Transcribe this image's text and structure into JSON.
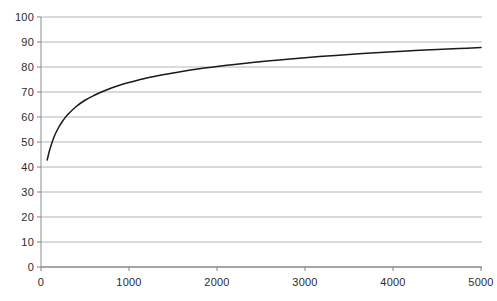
{
  "chart_data": {
    "type": "line",
    "title": "",
    "subtitle": "",
    "xlabel": "",
    "ylabel": "",
    "xlim": [
      0,
      5000
    ],
    "ylim": [
      0,
      100
    ],
    "grid": "horizontal",
    "legend": "none",
    "line_color": "#1a1a1a",
    "grid_color": "#b5b5b5",
    "axis_color": "#808080",
    "background_color": "#ffffff",
    "x_ticks": [
      0,
      1000,
      2000,
      3000,
      4000,
      5000
    ],
    "x_tick_labels": [
      "0",
      "1000",
      "2000",
      "3000",
      "4000",
      "5000"
    ],
    "y_ticks": [
      0,
      10,
      20,
      30,
      40,
      50,
      60,
      70,
      80,
      90,
      100
    ],
    "y_tick_labels": [
      "0",
      "10",
      "20",
      "30",
      "40",
      "50",
      "60",
      "70",
      "80",
      "90",
      "100"
    ],
    "series": [
      {
        "name": "curve",
        "x": [
          70,
          100,
          150,
          200,
          250,
          300,
          400,
          500,
          600,
          700,
          800,
          900,
          1000,
          1200,
          1400,
          1600,
          1800,
          2000,
          2200,
          2400,
          2600,
          2800,
          3000,
          3250,
          3500,
          3750,
          4000,
          4250,
          4500,
          4750,
          5000
        ],
        "y": [
          42.8,
          47.0,
          52.2,
          55.8,
          58.6,
          60.8,
          64.2,
          66.7,
          68.6,
          70.2,
          71.6,
          72.8,
          73.8,
          75.6,
          77.0,
          78.2,
          79.3,
          80.2,
          81.0,
          81.8,
          82.5,
          83.1,
          83.7,
          84.4,
          85.0,
          85.6,
          86.1,
          86.6,
          87.0,
          87.4,
          87.8
        ]
      }
    ]
  },
  "axes": {
    "y_labels": [
      "100",
      "90",
      "80",
      "70",
      "60",
      "50",
      "40",
      "30",
      "20",
      "10",
      "0"
    ],
    "x_labels": [
      "0",
      "1000",
      "2000",
      "3000",
      "4000",
      "5000"
    ]
  }
}
